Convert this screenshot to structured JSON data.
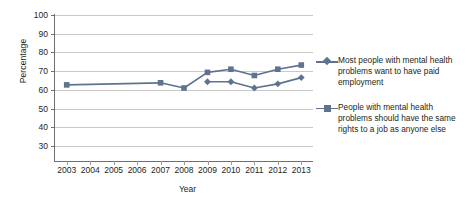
{
  "chart_data": {
    "type": "line",
    "title": "",
    "xlabel": "Year",
    "ylabel": "Percentage",
    "categories": [
      "2003",
      "2004",
      "2005",
      "2006",
      "2007",
      "2008",
      "2009",
      "2010",
      "2011",
      "2012",
      "2013"
    ],
    "ylim": [
      30,
      100
    ],
    "yticks": [
      30,
      40,
      50,
      60,
      70,
      80,
      90,
      100
    ],
    "grid": true,
    "legend_position": "right",
    "series": [
      {
        "name": "Most people with mental health problems want to have paid employment",
        "marker": "diamond",
        "color": "#5f7390",
        "values": [
          null,
          null,
          null,
          null,
          null,
          null,
          68,
          68,
          65,
          67,
          70
        ]
      },
      {
        "name": "People with mental health problems should have the same rights to a job as anyone else",
        "marker": "square",
        "color": "#5f7390",
        "values": [
          66.5,
          null,
          null,
          null,
          67.5,
          65,
          72.5,
          74,
          71,
          74,
          76
        ]
      }
    ]
  },
  "axes": {
    "y_title": "Percentage",
    "x_title": "Year",
    "y_tick_labels": [
      "100",
      "90",
      "80",
      "70",
      "60",
      "50",
      "40",
      "30"
    ],
    "x_tick_labels": [
      "2003",
      "2004",
      "2005",
      "2006",
      "2007",
      "2008",
      "2009",
      "2010",
      "2011",
      "2012",
      "2013"
    ]
  },
  "legend": {
    "entries": [
      {
        "marker": "diamond-marker-icon",
        "label": "Most people with mental health problems want to have paid employment"
      },
      {
        "marker": "square-marker-icon",
        "label": "People with mental health problems should have the same rights to a job as anyone else"
      }
    ]
  },
  "colors": {
    "series": "#5f7390",
    "gridline": "#c9c9c9",
    "axis": "#6f6f6f",
    "text": "#231f20",
    "background": "#ffffff"
  }
}
